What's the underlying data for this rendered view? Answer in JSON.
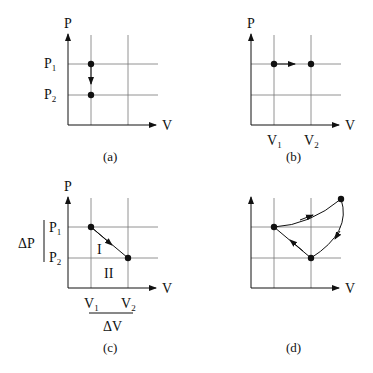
{
  "panels": [
    {
      "id": "a",
      "caption": "(a)",
      "y_axis": "P",
      "x_axis": "V",
      "p_labels": [
        "P",
        "P"
      ],
      "p_subs": [
        "1",
        "2"
      ],
      "process": "isochoric pressure drop from P1 to P2"
    },
    {
      "id": "b",
      "caption": "(b)",
      "y_axis": "P",
      "x_axis": "V",
      "v_labels": [
        "V",
        "V"
      ],
      "v_subs": [
        "1",
        "2"
      ],
      "process": "isobaric expansion from V1 to V2"
    },
    {
      "id": "c",
      "caption": "(c)",
      "y_axis": "P",
      "x_axis": "V",
      "p_labels": [
        "P",
        "P"
      ],
      "p_subs": [
        "1",
        "2"
      ],
      "v_labels": [
        "V",
        "V"
      ],
      "v_subs": [
        "1",
        "2"
      ],
      "region_labels": [
        "I",
        "II"
      ],
      "delta_p": "ΔP",
      "delta_v": "ΔV",
      "process": "straight line from (V1,P1) to (V2,P2)"
    },
    {
      "id": "d",
      "caption": "(d)",
      "y_axis": "P",
      "x_axis": "V",
      "process": "cyclic process"
    }
  ]
}
